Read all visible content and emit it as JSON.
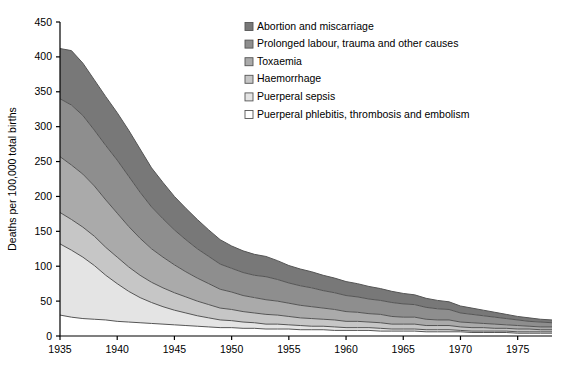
{
  "chart_data": {
    "type": "area",
    "stacked": true,
    "title": "",
    "xlabel": "",
    "ylabel": "Deaths per 100,000 total births",
    "xlim": [
      1935,
      1978
    ],
    "ylim": [
      0,
      450
    ],
    "ytick_step": 50,
    "xtick_step": 5,
    "grid": false,
    "legend_position": "top-right",
    "yticks": [
      "0",
      "50",
      "100",
      "150",
      "200",
      "250",
      "300",
      "350",
      "400",
      "450"
    ],
    "xticks": [
      "1935",
      "1940",
      "1945",
      "1950",
      "1955",
      "1960",
      "1965",
      "1970",
      "1975"
    ],
    "x": [
      1935,
      1936,
      1937,
      1938,
      1939,
      1940,
      1941,
      1942,
      1943,
      1944,
      1945,
      1946,
      1947,
      1948,
      1949,
      1950,
      1951,
      1952,
      1953,
      1954,
      1955,
      1956,
      1957,
      1958,
      1959,
      1960,
      1961,
      1962,
      1963,
      1964,
      1965,
      1966,
      1967,
      1968,
      1969,
      1970,
      1971,
      1972,
      1973,
      1974,
      1975,
      1976,
      1977,
      1978
    ],
    "series": [
      {
        "name": "Puerperal phlebitis, thrombosis and embolism",
        "color": "#ffffff",
        "values": [
          30,
          27,
          25,
          24,
          23,
          21,
          20,
          19,
          18,
          17,
          16,
          15,
          14,
          13,
          12,
          12,
          11,
          11,
          10,
          10,
          10,
          9,
          9,
          9,
          8,
          8,
          8,
          8,
          7,
          7,
          7,
          7,
          6,
          6,
          6,
          6,
          5,
          5,
          5,
          5,
          4,
          4,
          4,
          4
        ]
      },
      {
        "name": "Puerperal sepsis",
        "color": "#e4e4e4",
        "values": [
          102,
          96,
          88,
          77,
          64,
          54,
          44,
          36,
          30,
          25,
          21,
          18,
          15,
          13,
          11,
          10,
          9,
          8,
          7,
          7,
          6,
          6,
          5,
          5,
          5,
          4,
          4,
          4,
          4,
          3,
          3,
          3,
          3,
          3,
          3,
          2,
          2,
          2,
          2,
          2,
          2,
          2,
          2,
          2
        ]
      },
      {
        "name": "Haemorrhage",
        "color": "#c6c6c6",
        "values": [
          45,
          44,
          43,
          42,
          40,
          38,
          35,
          32,
          29,
          27,
          25,
          23,
          21,
          19,
          17,
          16,
          15,
          14,
          14,
          13,
          12,
          11,
          11,
          10,
          10,
          9,
          9,
          8,
          8,
          7,
          7,
          7,
          6,
          6,
          6,
          5,
          5,
          5,
          4,
          4,
          4,
          4,
          3,
          3
        ]
      },
      {
        "name": "Toxaemia",
        "color": "#aaaaaa",
        "values": [
          80,
          78,
          76,
          72,
          68,
          63,
          58,
          53,
          48,
          44,
          40,
          36,
          33,
          30,
          27,
          25,
          23,
          22,
          21,
          20,
          19,
          18,
          17,
          16,
          15,
          14,
          13,
          12,
          12,
          11,
          10,
          10,
          9,
          8,
          8,
          7,
          7,
          6,
          6,
          5,
          5,
          4,
          4,
          4
        ]
      },
      {
        "name": "Prolonged labour, trauma and other causes",
        "color": "#8e8e8e",
        "values": [
          83,
          86,
          84,
          80,
          78,
          76,
          72,
          66,
          60,
          55,
          50,
          46,
          42,
          39,
          36,
          34,
          33,
          32,
          33,
          31,
          29,
          28,
          27,
          25,
          24,
          23,
          22,
          21,
          20,
          20,
          19,
          18,
          17,
          16,
          15,
          13,
          12,
          11,
          10,
          9,
          8,
          7,
          7,
          6
        ]
      },
      {
        "name": "Abortion and miscarriage",
        "color": "#787878",
        "values": [
          72,
          78,
          75,
          72,
          70,
          68,
          66,
          62,
          56,
          52,
          48,
          45,
          42,
          38,
          35,
          32,
          31,
          30,
          29,
          27,
          25,
          24,
          23,
          22,
          21,
          20,
          19,
          18,
          17,
          16,
          15,
          14,
          13,
          12,
          11,
          10,
          9,
          8,
          7,
          6,
          5,
          5,
          4,
          4
        ]
      }
    ],
    "legend": [
      {
        "label": "Abortion and miscarriage",
        "color": "#787878"
      },
      {
        "label": "Prolonged labour, trauma and other causes",
        "color": "#8e8e8e"
      },
      {
        "label": "Toxaemia",
        "color": "#aaaaaa"
      },
      {
        "label": "Haemorrhage",
        "color": "#c6c6c6"
      },
      {
        "label": "Puerperal sepsis",
        "color": "#e4e4e4"
      },
      {
        "label": "Puerperal phlebitis, thrombosis and embolism",
        "color": "#ffffff"
      }
    ],
    "stroke_color": "#555555",
    "axis_color": "#000000"
  }
}
